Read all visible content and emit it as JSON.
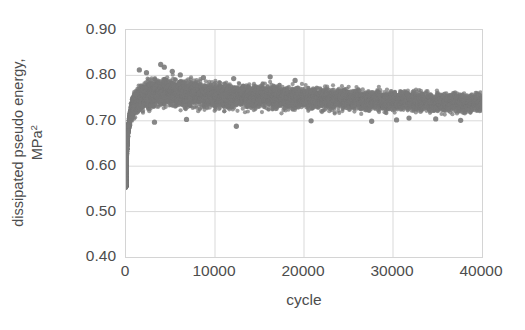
{
  "chart_data": {
    "type": "scatter",
    "title": "",
    "subtitle": "",
    "xlabel": "cycle",
    "ylabel": "dissipated pseudo energy, MPa²",
    "ylabel_line1": "dissipated pseudo energy,",
    "ylabel_line2": "MPa",
    "ylabel_line2_sup": "2",
    "xlim": [
      0,
      40000
    ],
    "ylim": [
      0.4,
      0.9
    ],
    "xticks": [
      0,
      10000,
      20000,
      30000,
      40000
    ],
    "xtick_labels": [
      "0",
      "10000",
      "20000",
      "30000",
      "40000"
    ],
    "yticks": [
      0.4,
      0.5,
      0.6,
      0.7,
      0.8,
      0.9
    ],
    "ytick_labels": [
      "0.40",
      "0.50",
      "0.60",
      "0.70",
      "0.80",
      "0.90"
    ],
    "grid": true,
    "grid_x": true,
    "grid_y": true,
    "grid_color": "#d9d9d9",
    "frame_color": "#d4d4d4",
    "legend": false,
    "legend_position": "none",
    "marker_color": "#7a7a7a",
    "marker_shape": "circle",
    "marker_size_px": 4.2,
    "marker_opacity": 0.75,
    "series": [
      {
        "name": "dissipated pseudo energy",
        "description": "Dense scatter cloud: sharp rise from ~0.555 at cycle 0 to a peak band near 0.80 by ~3000 cycles, then a slowly decaying scatter band centred near 0.745 and narrowing slightly toward 40000 cycles.",
        "n_points_approx": 40000,
        "start_value": 0.555,
        "peak_value": 0.825,
        "peak_cycle": 4200,
        "end_value_center": 0.74,
        "band_half_width_start": 0.006,
        "band_half_width_peak": 0.03,
        "band_half_width_end": 0.021,
        "control_points": [
          {
            "cycle": 0,
            "center": 0.556,
            "half_width": 0.004
          },
          {
            "cycle": 60,
            "center": 0.604,
            "half_width": 0.01
          },
          {
            "cycle": 150,
            "center": 0.652,
            "half_width": 0.014
          },
          {
            "cycle": 300,
            "center": 0.69,
            "half_width": 0.018
          },
          {
            "cycle": 600,
            "center": 0.722,
            "half_width": 0.024
          },
          {
            "cycle": 1000,
            "center": 0.74,
            "half_width": 0.028
          },
          {
            "cycle": 1800,
            "center": 0.752,
            "half_width": 0.031
          },
          {
            "cycle": 3000,
            "center": 0.76,
            "half_width": 0.033
          },
          {
            "cycle": 4500,
            "center": 0.762,
            "half_width": 0.034
          },
          {
            "cycle": 7000,
            "center": 0.759,
            "half_width": 0.032
          },
          {
            "cycle": 11000,
            "center": 0.755,
            "half_width": 0.03
          },
          {
            "cycle": 16000,
            "center": 0.752,
            "half_width": 0.028
          },
          {
            "cycle": 21000,
            "center": 0.749,
            "half_width": 0.026
          },
          {
            "cycle": 26000,
            "center": 0.746,
            "half_width": 0.025
          },
          {
            "cycle": 31000,
            "center": 0.743,
            "half_width": 0.024
          },
          {
            "cycle": 36000,
            "center": 0.741,
            "half_width": 0.023
          },
          {
            "cycle": 40000,
            "center": 0.739,
            "half_width": 0.021
          }
        ],
        "outliers": [
          {
            "cycle": 1500,
            "value": 0.812
          },
          {
            "cycle": 2300,
            "value": 0.806
          },
          {
            "cycle": 3900,
            "value": 0.824
          },
          {
            "cycle": 4300,
            "value": 0.818
          },
          {
            "cycle": 5200,
            "value": 0.809
          },
          {
            "cycle": 6100,
            "value": 0.801
          },
          {
            "cycle": 8700,
            "value": 0.795
          },
          {
            "cycle": 12100,
            "value": 0.793
          },
          {
            "cycle": 16200,
            "value": 0.797
          },
          {
            "cycle": 19000,
            "value": 0.789
          },
          {
            "cycle": 3200,
            "value": 0.697
          },
          {
            "cycle": 6800,
            "value": 0.703
          },
          {
            "cycle": 12400,
            "value": 0.688
          },
          {
            "cycle": 20800,
            "value": 0.7
          },
          {
            "cycle": 27600,
            "value": 0.699
          },
          {
            "cycle": 30400,
            "value": 0.702
          },
          {
            "cycle": 34800,
            "value": 0.704
          },
          {
            "cycle": 37600,
            "value": 0.701
          },
          {
            "cycle": 31800,
            "value": 0.706
          }
        ]
      }
    ]
  }
}
